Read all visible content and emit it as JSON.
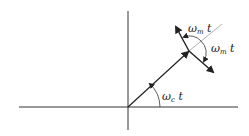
{
  "diagram": {
    "title": "",
    "labels": {
      "carrier_angle": {
        "symbol": "ω",
        "sub": "c",
        "suffix": " t"
      },
      "sideband_angle_upper": {
        "symbol": "ω",
        "sub": "m",
        "suffix": " t"
      },
      "sideband_angle_lower": {
        "symbol": "ω",
        "sub": "m",
        "suffix": " t"
      }
    },
    "colors": {
      "axis": "#333333",
      "vector": "#222222",
      "reference_line": "#999999",
      "background": "#ffffff"
    }
  }
}
